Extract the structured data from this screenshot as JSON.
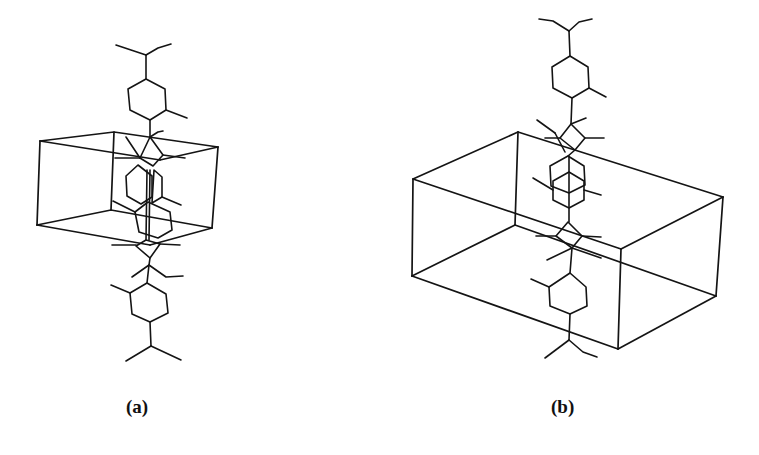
{
  "figure": {
    "panels": [
      {
        "id": "a",
        "label": "(a)",
        "description": "Unit cell (box) with stacked molecular chain passing vertically through the cell",
        "unit_cell": {
          "front_top_left": [
            40,
            141
          ],
          "back_top": [
            114,
            132
          ],
          "front_top_right": [
            218,
            147
          ],
          "front_bottom_left": [
            37,
            225
          ],
          "back_bottom": [
            111,
            210
          ],
          "front_bottom_right": [
            212,
            228
          ]
        }
      },
      {
        "id": "b",
        "label": "(b)",
        "description": "Larger unit cell (box) viewed at a different orientation with molecular chain passing through",
        "unit_cell": {
          "left_top": [
            413,
            179
          ],
          "back_top": [
            518,
            132
          ],
          "right_top": [
            723,
            197
          ],
          "front_top": [
            621,
            249
          ],
          "left_bottom": [
            412,
            276
          ],
          "back_bottom": [
            515,
            225
          ],
          "right_bottom": [
            716,
            296
          ],
          "front_bottom": [
            618,
            349
          ]
        }
      }
    ],
    "line_color": "#141414",
    "background": "#ffffff"
  }
}
